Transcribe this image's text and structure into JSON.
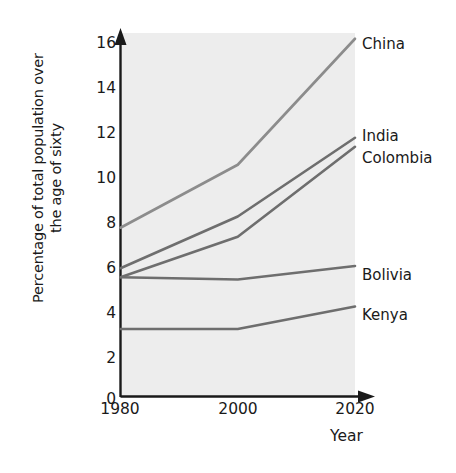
{
  "chart_data": {
    "type": "line",
    "title": "",
    "xlabel": "Year",
    "ylabel": "Percentage of total population over the age of sixty",
    "ylabel_line1": "Percentage of total population over",
    "ylabel_line2": "the age of sixty",
    "x": [
      1980,
      2000,
      2020
    ],
    "categories": [
      "1980",
      "2000",
      "2020"
    ],
    "xtick_labels": [
      "1980",
      "2000",
      "2020"
    ],
    "ytick_labels": [
      "0",
      "2",
      "4",
      "6",
      "8",
      "10",
      "12",
      "14",
      "16"
    ],
    "ytick_values": [
      0,
      2,
      4,
      6,
      8,
      10,
      12,
      14,
      16
    ],
    "ylim": [
      0,
      16.8
    ],
    "xlim": [
      1980,
      2020
    ],
    "grid": false,
    "legend_position": "right-of-axes-inline",
    "series": [
      {
        "name": "China",
        "values": [
          7.5,
          10.3,
          15.9
        ],
        "color": "#8c8c8c"
      },
      {
        "name": "India",
        "values": [
          5.7,
          8.0,
          11.5
        ],
        "color": "#6e6e6e"
      },
      {
        "name": "Colombia",
        "values": [
          5.3,
          7.1,
          11.1
        ],
        "color": "#6e6e6e"
      },
      {
        "name": "Bolivia",
        "values": [
          5.3,
          5.2,
          5.8
        ],
        "color": "#6e6e6e"
      },
      {
        "name": "Kenya",
        "values": [
          3.0,
          3.0,
          4.0
        ],
        "color": "#6e6e6e"
      }
    ]
  },
  "colors": {
    "plot_background": "#ededed",
    "axis": "#1a1a1a",
    "text": "#1a1a1a",
    "line_light": "#8c8c8c",
    "line_dark": "#6e6e6e"
  }
}
